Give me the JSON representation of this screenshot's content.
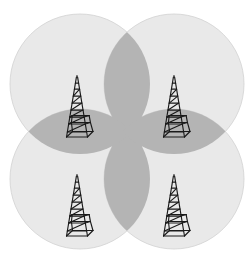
{
  "figure": {
    "background_color": "#ffffff",
    "width": 252,
    "height": 262
  },
  "colors": {
    "coverage_fill": "#e9e9e9",
    "overlap_fill": "#b4b4b4",
    "coverage_stroke": "#d2d2d2",
    "tower_stroke": "#1a1a1a",
    "background": "#ffffff"
  },
  "layout": {
    "circle_radius": 70,
    "coverage_opacity": 1,
    "overlap_opacity": 1
  },
  "coverage_areas": [
    {
      "id": "cell-nw",
      "label": "",
      "center_x": 80,
      "center_y": 84,
      "radius": 70,
      "fill": "#e9e9e9"
    },
    {
      "id": "cell-ne",
      "label": "",
      "center_x": 174,
      "center_y": 84,
      "radius": 70,
      "fill": "#e9e9e9"
    },
    {
      "id": "cell-sw",
      "label": "",
      "center_x": 80,
      "center_y": 179,
      "radius": 70,
      "fill": "#e9e9e9"
    },
    {
      "id": "cell-se",
      "label": "",
      "center_x": 174,
      "center_y": 179,
      "radius": 70,
      "fill": "#e9e9e9"
    }
  ],
  "overlap_regions": [
    {
      "id": "overlap-top",
      "pair": "cell-nw + cell-ne",
      "fill": "#b4b4b4"
    },
    {
      "id": "overlap-bottom",
      "pair": "cell-sw + cell-se",
      "fill": "#b4b4b4"
    },
    {
      "id": "overlap-left",
      "pair": "cell-nw + cell-sw",
      "fill": "#b4b4b4"
    },
    {
      "id": "overlap-right",
      "pair": "cell-ne + cell-se",
      "fill": "#b4b4b4"
    }
  ],
  "towers": [
    {
      "id": "tower-nw",
      "label": "",
      "base_x": 77,
      "base_y": 139,
      "height": 57,
      "half_width": 16,
      "rungs": 7,
      "stroke": "#1a1a1a"
    },
    {
      "id": "tower-ne",
      "label": "",
      "base_x": 174,
      "base_y": 139,
      "height": 57,
      "half_width": 16,
      "rungs": 7,
      "stroke": "#1a1a1a"
    },
    {
      "id": "tower-sw",
      "label": "",
      "base_x": 77,
      "base_y": 238,
      "height": 57,
      "half_width": 16,
      "rungs": 7,
      "stroke": "#1a1a1a"
    },
    {
      "id": "tower-se",
      "label": "",
      "base_x": 174,
      "base_y": 238,
      "height": 57,
      "half_width": 16,
      "rungs": 7,
      "stroke": "#1a1a1a"
    }
  ]
}
